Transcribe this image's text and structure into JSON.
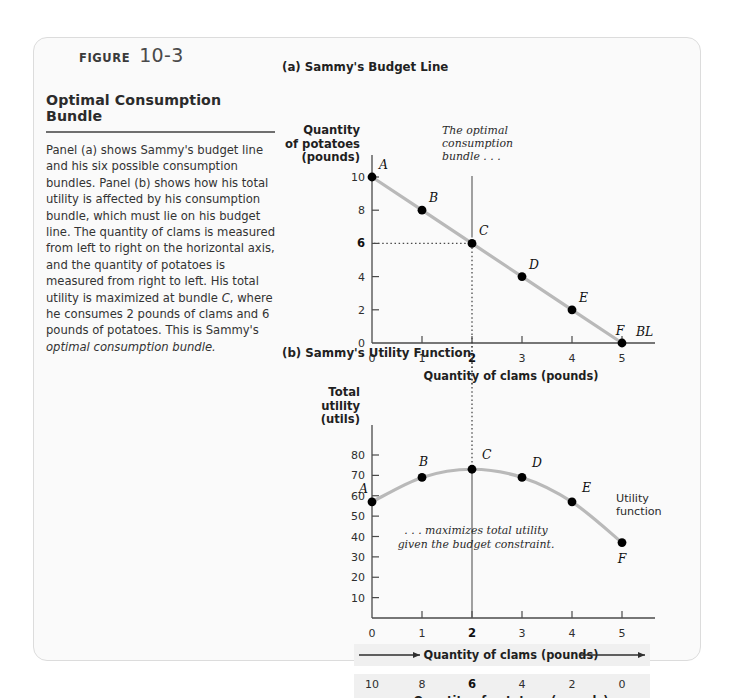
{
  "header": {
    "figure_word": "FIGURE",
    "figure_number": "10-3"
  },
  "description": {
    "title": "Optimal Consumption Bundle",
    "body_html": "Panel (a) shows Sammy's budget line and his six possible consumption bundles. Panel (b) shows how his total utility is affected by his consumption bundle, which must lie on his budget line. The quantity of clams is measured from left to right on the horizontal axis, and the quantity of potatoes is measured from right to left. His total utility is maximized at bundle <i>C</i>, where he consumes 2 pounds of clams and 6 pounds of potatoes. This is Sammy's <i>optimal consumption bundle.</i>"
  },
  "panel_a": {
    "title": "(a) Sammy's Budget Line",
    "annotation": [
      "The optimal",
      "consumption",
      "bundle . . ."
    ],
    "line_label": "BL"
  },
  "panel_b": {
    "title": "(b) Sammy's Utility Function",
    "annotation": [
      ". . . maximizes total utility",
      "given the budget constraint."
    ],
    "curve_label": [
      "Utility",
      "function"
    ]
  },
  "chart_data": [
    {
      "type": "line",
      "title": "(a) Sammy's Budget Line",
      "ylabel": [
        "Quantity",
        "of potatoes",
        "(pounds)"
      ],
      "xlabel": "Quantity of clams (pounds)",
      "xlim": [
        0,
        5
      ],
      "ylim": [
        0,
        10
      ],
      "xticks": [
        0,
        1,
        2,
        3,
        4,
        5
      ],
      "xtick_labels": [
        "0",
        "1",
        "2",
        "3",
        "4",
        "5"
      ],
      "yticks": [
        0,
        2,
        4,
        6,
        8,
        10
      ],
      "ytick_labels": [
        "0",
        "2",
        "4",
        "6",
        "8",
        "10"
      ],
      "highlight_xtick": "2",
      "highlight_ytick": "6",
      "grid": false,
      "series_name": "BL",
      "x": [
        0,
        1,
        2,
        3,
        4,
        5
      ],
      "values": [
        10,
        8,
        6,
        4,
        2,
        0
      ],
      "point_labels": [
        "A",
        "B",
        "C",
        "D",
        "E",
        "F"
      ],
      "optimal_point": "C",
      "optimal_x": 2,
      "optimal_y": 6
    },
    {
      "type": "line",
      "title": "(b) Sammy's Utility Function",
      "ylabel": [
        "Total",
        "utility",
        "(utils)"
      ],
      "xlabel": "Quantity of clams (pounds)",
      "xlabel2": "Quantity of potatoes (pounds)",
      "xlim": [
        0,
        5
      ],
      "ylim": [
        0,
        80
      ],
      "xticks": [
        0,
        1,
        2,
        3,
        4,
        5
      ],
      "xtick_labels": [
        "0",
        "1",
        "2",
        "3",
        "4",
        "5"
      ],
      "xtick_labels2": [
        "10",
        "8",
        "6",
        "4",
        "2",
        "0"
      ],
      "yticks": [
        10,
        20,
        30,
        40,
        50,
        60,
        70,
        80
      ],
      "ytick_labels": [
        "10",
        "20",
        "30",
        "40",
        "50",
        "60",
        "70",
        "80"
      ],
      "highlight_xtick": "2",
      "highlight_xtick2": "6",
      "grid": false,
      "series_name": "Utility function",
      "x": [
        0,
        1,
        2,
        3,
        4,
        5
      ],
      "values": [
        57,
        69,
        73,
        69,
        57,
        37
      ],
      "point_labels": [
        "A",
        "B",
        "C",
        "D",
        "E",
        "F"
      ],
      "optimal_point": "C",
      "optimal_x": 2,
      "optimal_y": 73
    }
  ]
}
